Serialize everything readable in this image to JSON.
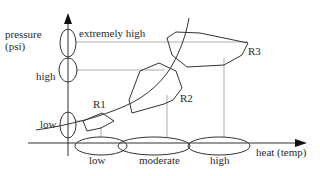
{
  "diagram": {
    "y_axis": {
      "label_line1": "pressure",
      "label_line2": "(psi)",
      "levels": [
        {
          "label": "extremely high"
        },
        {
          "label": "high"
        },
        {
          "label": "low"
        }
      ]
    },
    "x_axis": {
      "label": "heat (temp)",
      "levels": [
        {
          "label": "low"
        },
        {
          "label": "moderate"
        },
        {
          "label": "high"
        }
      ]
    },
    "regions": [
      {
        "label": "R1"
      },
      {
        "label": "R2"
      },
      {
        "label": "R3"
      }
    ],
    "colors": {
      "line": "#333333",
      "guide": "#777777",
      "text": "#2a2a2a",
      "background": "#ffffff"
    }
  }
}
